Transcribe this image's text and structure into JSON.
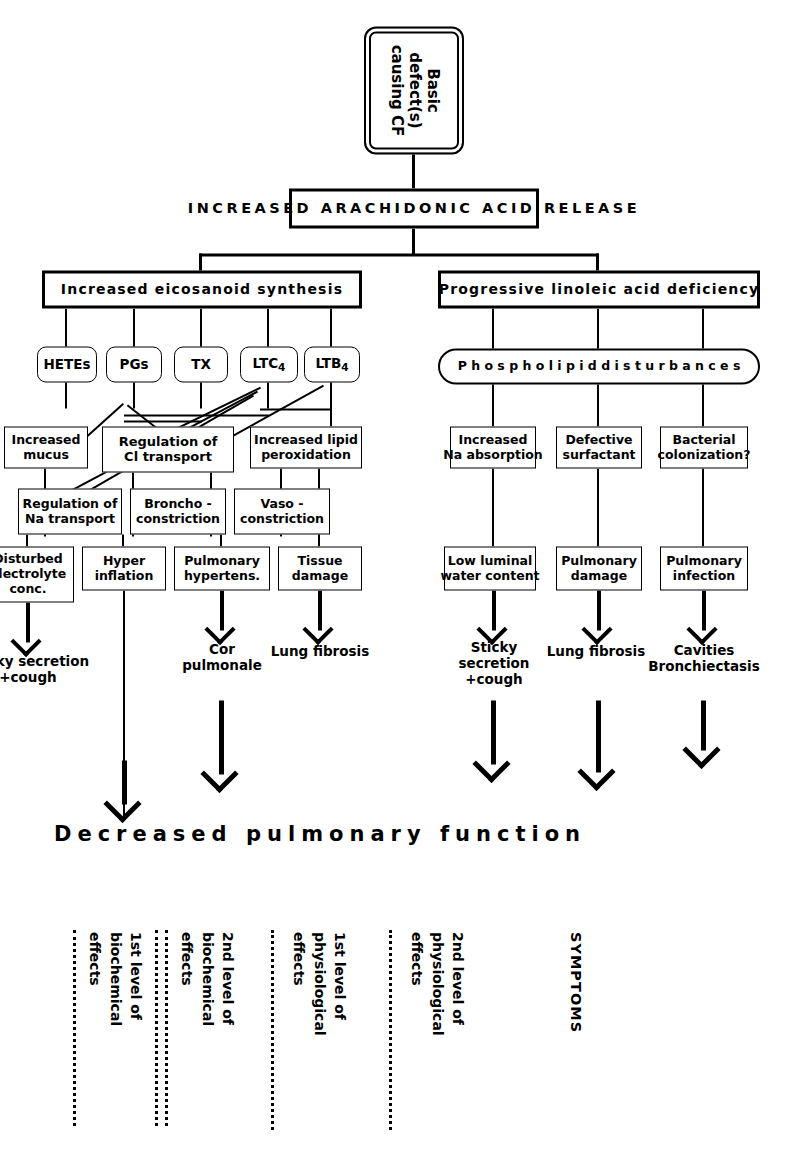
{
  "figure": {
    "title": "Basic defect(s) causing CF",
    "root": "Basic defect(s) causing CF",
    "release_banner": "INCREASED ARACHIDONIC ACID RELEASE",
    "outcome_banner": "Decreased pulmonary function"
  },
  "level_labels": [
    {
      "id": "lvl1",
      "lines": [
        "1st level of",
        "biochemical",
        "effects"
      ]
    },
    {
      "id": "lvl2",
      "lines": [
        "2nd level of",
        "biochemical",
        "effects"
      ]
    },
    {
      "id": "lvl3",
      "lines": [
        "1st level of",
        "physiological",
        "effects"
      ]
    },
    {
      "id": "lvl4",
      "lines": [
        "2nd level of",
        "physiological",
        "effects"
      ]
    },
    {
      "id": "lvl5",
      "lines": [
        "SYMPTOMS"
      ]
    }
  ],
  "branches": {
    "eicosanoid": {
      "label": "Increased  eicosanoid  synthesis",
      "mediators": [
        {
          "id": "hetes",
          "label": "HETEs"
        },
        {
          "id": "pgs",
          "label": "PGs"
        },
        {
          "id": "tx",
          "label": "TX"
        },
        {
          "id": "ltc4",
          "label": "LTC4",
          "base": "LTC",
          "sub": "4"
        },
        {
          "id": "ltb4",
          "label": "LTB4",
          "base": "LTB",
          "sub": "4"
        }
      ]
    },
    "linoleic": {
      "label": "Progressive linoleic acid deficiency",
      "phospholipid": "P h o s p h o l i p i d   d i s t u r b a n c e s"
    }
  },
  "physio1": [
    {
      "id": "incmucus",
      "lines": [
        "Increased",
        "mucus"
      ]
    },
    {
      "id": "regcl",
      "lines": [
        "Regulation of",
        "Cl transport"
      ]
    },
    {
      "id": "incperox",
      "lines": [
        "Increased lipid",
        "peroxidation"
      ]
    },
    {
      "id": "regna",
      "lines": [
        "Regulation of",
        "Na transport"
      ]
    },
    {
      "id": "broncho",
      "lines": [
        "Broncho -",
        "constriction"
      ]
    },
    {
      "id": "vaso",
      "lines": [
        "Vaso -",
        "constriction"
      ]
    },
    {
      "id": "incna",
      "lines": [
        "Increased",
        "Na absorption"
      ]
    },
    {
      "id": "defsurf",
      "lines": [
        "Defective",
        "surfactant"
      ]
    },
    {
      "id": "bactcol",
      "lines": [
        "Bacterial",
        "colonization?"
      ]
    }
  ],
  "physio2": [
    {
      "id": "viscous",
      "lines": [
        "Viscous",
        "secretion"
      ]
    },
    {
      "id": "disturbed",
      "lines": [
        "Disturbed",
        "electrolyte",
        "conc."
      ]
    },
    {
      "id": "hyperinf",
      "lines": [
        "Hyper",
        "inflation"
      ]
    },
    {
      "id": "pulmhyp",
      "lines": [
        "Pulmonary",
        "hypertens."
      ]
    },
    {
      "id": "tissdam",
      "lines": [
        "Tissue",
        "damage"
      ]
    },
    {
      "id": "lowwater",
      "lines": [
        "Low luminal",
        "water content"
      ]
    },
    {
      "id": "pulmdam",
      "lines": [
        "Pulmonary",
        "damage"
      ]
    },
    {
      "id": "pulminf",
      "lines": [
        "Pulmonary",
        "infection"
      ]
    }
  ],
  "symptoms": [
    {
      "id": "sticky1",
      "lines": [
        "Sticky secretion",
        "+cough"
      ]
    },
    {
      "id": "sticky2",
      "lines": [
        "Sticky secretion",
        "+cough"
      ]
    },
    {
      "id": "cor",
      "lines": [
        "Cor",
        "pulmonale"
      ]
    },
    {
      "id": "fib1",
      "lines": [
        "Lung fibrosis"
      ]
    },
    {
      "id": "sticky3",
      "lines": [
        "Sticky",
        "secretion",
        "+cough"
      ]
    },
    {
      "id": "fib2",
      "lines": [
        "Lung fibrosis"
      ]
    },
    {
      "id": "cav",
      "lines": [
        "Cavities",
        "Bronchiectasis"
      ]
    }
  ]
}
